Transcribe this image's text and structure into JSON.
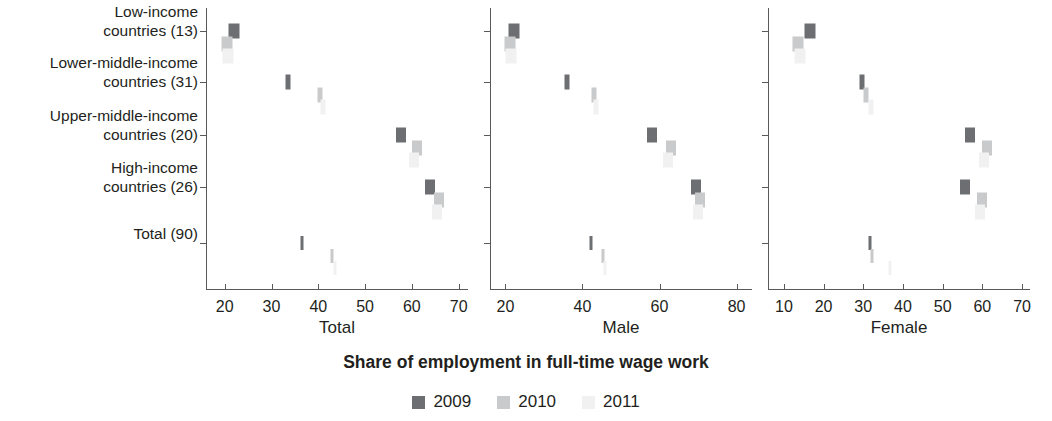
{
  "axis_title": "Share of employment in full-time wage work",
  "legend": {
    "items": [
      {
        "label": "2009",
        "color": "#6d6e71"
      },
      {
        "label": "2010",
        "color": "#c9cacb"
      },
      {
        "label": "2011",
        "color": "#f1f1f1"
      }
    ]
  },
  "categories": [
    {
      "line1": "Low-income",
      "line2": "countries (13)"
    },
    {
      "line1": "Lower-middle-income",
      "line2": "countries (31)"
    },
    {
      "line1": "Upper-middle-income",
      "line2": "countries (20)"
    },
    {
      "line1": "High-income",
      "line2": "countries (26)"
    },
    {
      "line1": "",
      "line2": "Total (90)"
    }
  ],
  "panels": [
    {
      "caption": "Total",
      "ticks": [
        20,
        30,
        40,
        50,
        60,
        70
      ],
      "xlim": [
        16,
        72
      ]
    },
    {
      "caption": "Male",
      "ticks": [
        20,
        40,
        60,
        80
      ],
      "xlim": [
        16,
        84
      ]
    },
    {
      "caption": "Female",
      "ticks": [
        10,
        20,
        30,
        40,
        50,
        60,
        70
      ],
      "xlim": [
        6,
        72
      ]
    }
  ],
  "chart_data": {
    "type": "scatter",
    "title": "",
    "xlabel": "Share of employment in full-time wage work",
    "ylabel": "",
    "grid": false,
    "legend_position": "bottom-center",
    "categories": [
      "Low-income countries (13)",
      "Lower-middle-income countries (31)",
      "Upper-middle-income countries (20)",
      "High-income countries (26)",
      "Total (90)"
    ],
    "panels": [
      {
        "name": "Total",
        "xlim": [
          16,
          72
        ],
        "xticks": [
          20,
          30,
          40,
          50,
          60,
          70
        ],
        "series": [
          {
            "name": "2009",
            "color": "#6d6e71",
            "values": [
              22.0,
              33.6,
              57.7,
              63.9,
              36.5
            ]
          },
          {
            "name": "2010",
            "color": "#c9cacb",
            "values": [
              20.4,
              40.3,
              61.0,
              65.9,
              43.0
            ]
          },
          {
            "name": "2011",
            "color": "#f1f1f1",
            "values": [
              20.8,
              41.0,
              60.4,
              65.4,
              43.5
            ]
          }
        ]
      },
      {
        "name": "Male",
        "xlim": [
          16,
          84
        ],
        "xticks": [
          20,
          40,
          60,
          80
        ],
        "series": [
          {
            "name": "2009",
            "color": "#6d6e71",
            "values": [
              22.2,
              36.1,
              58.1,
              69.4,
              42.3
            ]
          },
          {
            "name": "2010",
            "color": "#c9cacb",
            "values": [
              21.2,
              43.0,
              62.9,
              70.5,
              45.4
            ]
          },
          {
            "name": "2011",
            "color": "#f1f1f1",
            "values": [
              21.5,
              43.4,
              62.2,
              70.1,
              45.8
            ]
          }
        ]
      },
      {
        "name": "Female",
        "xlim": [
          6,
          72
        ],
        "xticks": [
          10,
          20,
          30,
          40,
          50,
          60,
          70
        ],
        "series": [
          {
            "name": "2009",
            "color": "#6d6e71",
            "values": [
              16.6,
              29.6,
              56.8,
              55.6,
              31.6
            ]
          },
          {
            "name": "2010",
            "color": "#c9cacb",
            "values": [
              13.6,
              30.8,
              61.2,
              59.9,
              32.2
            ]
          },
          {
            "name": "2011",
            "color": "#f1f1f1",
            "values": [
              14.1,
              31.9,
              60.5,
              59.4,
              36.8
            ]
          }
        ]
      }
    ]
  }
}
